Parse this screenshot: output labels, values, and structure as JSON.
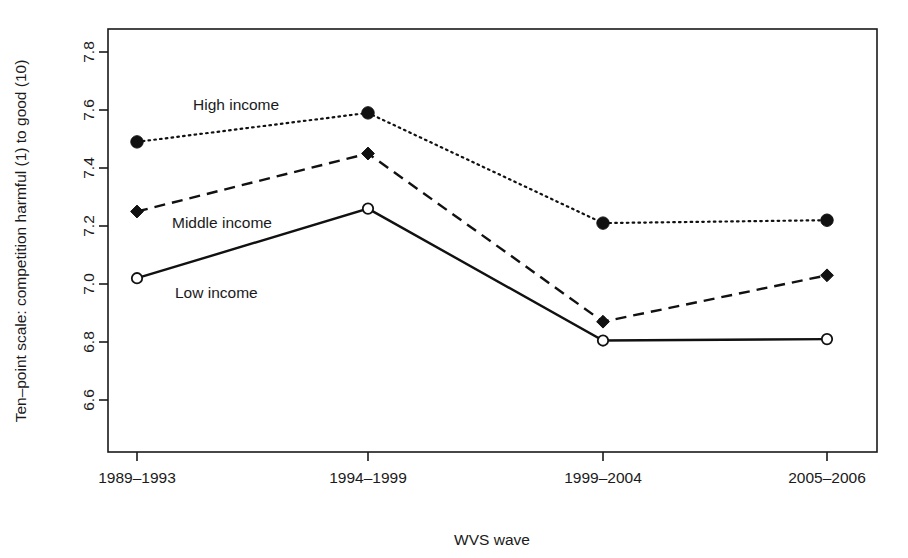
{
  "chart_data": {
    "type": "line",
    "title": "",
    "xlabel": "WVS wave",
    "ylabel": "Ten–point scale: competition harmful (1) to good (10)",
    "categories": [
      "1989–1993",
      "1994–1999",
      "1999–2004",
      "2005–2006"
    ],
    "ylim": [
      6.5,
      7.9
    ],
    "yticks": [
      "6.6",
      "6.8",
      "7.0",
      "7.2",
      "7.4",
      "7.6",
      "7.8"
    ],
    "ytick_values": [
      6.6,
      6.8,
      7.0,
      7.2,
      7.4,
      7.6,
      7.8
    ],
    "grid": false,
    "legend_position": "inline-annotations",
    "series": [
      {
        "name": "High income",
        "values": [
          7.49,
          7.59,
          7.21,
          7.22
        ],
        "linestyle": "dotted",
        "marker": "filled-circle",
        "color": "#111111",
        "label_x": "1989–1993",
        "label_anchor_value": 7.65
      },
      {
        "name": "Middle income",
        "values": [
          7.25,
          7.45,
          6.87,
          7.03
        ],
        "linestyle": "dashed",
        "marker": "filled-diamond",
        "color": "#111111",
        "label_x": "1989–1993",
        "label_anchor_value": 7.21
      },
      {
        "name": "Low income",
        "values": [
          7.02,
          7.26,
          6.805,
          6.81
        ],
        "linestyle": "solid",
        "marker": "open-circle",
        "color": "#111111",
        "label_x": "1989–1993",
        "label_anchor_value": 6.98
      }
    ],
    "annotations": [
      {
        "text": "High income",
        "x_px": 193,
        "y_px": 110
      },
      {
        "text": "Middle income",
        "x_px": 172,
        "y_px": 228
      },
      {
        "text": "Low income",
        "x_px": 175,
        "y_px": 298
      }
    ]
  },
  "axes": {
    "x_title": "WVS wave",
    "y_title": "Ten–point scale: competition harmful (1) to good (10)"
  },
  "colors": {
    "foreground": "#1a1a1a",
    "background": "#ffffff",
    "line": "#111111"
  }
}
